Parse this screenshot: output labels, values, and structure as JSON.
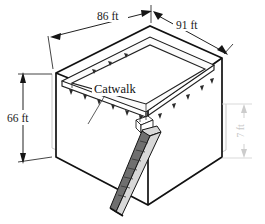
{
  "figure": {
    "background_color": "#ffffff",
    "line_color": "#111111",
    "faint_line_color": "#c8c8c8",
    "ramp_color": "#6f6f6f"
  },
  "labels": {
    "catwalk": "Catwalk"
  },
  "dimensions": {
    "top_left": {
      "value": "86 ft",
      "measures": "top front-left edge length",
      "style": "solid-black"
    },
    "top_right": {
      "value": "91 ft",
      "measures": "top front-right edge length",
      "style": "solid-black"
    },
    "left_vertical": {
      "value": "66 ft",
      "measures": "bin height at left front corner",
      "style": "solid-black"
    },
    "right_vertical": {
      "value": "7 ft",
      "measures": "depth at right rear",
      "style": "faint-gray",
      "rotated": true
    }
  }
}
